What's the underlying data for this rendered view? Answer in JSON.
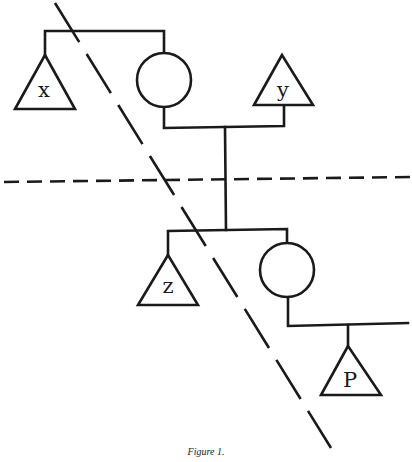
{
  "figure": {
    "caption": "Figure 1.",
    "type": "genealogy-pedigree-diagram",
    "line_color": "#1a1a1a",
    "background": "#ffffff"
  },
  "nodes": [
    {
      "id": "x",
      "shape": "triangle",
      "label": "x",
      "generation": 1
    },
    {
      "id": "circle-top",
      "shape": "circle",
      "label": "",
      "generation": 1
    },
    {
      "id": "y",
      "shape": "triangle",
      "label": "y",
      "generation": 1
    },
    {
      "id": "z",
      "shape": "triangle",
      "label": "z",
      "generation": 2
    },
    {
      "id": "circle-bottom",
      "shape": "circle",
      "label": "",
      "generation": 2
    },
    {
      "id": "P",
      "shape": "triangle",
      "label": "P",
      "generation": 3
    }
  ],
  "dividers": [
    {
      "id": "horizontal-dashed",
      "orientation": "horizontal"
    },
    {
      "id": "diagonal-dashed",
      "orientation": "diagonal"
    }
  ],
  "labels": {
    "x": "x",
    "y": "y",
    "z": "z",
    "p": "P"
  }
}
